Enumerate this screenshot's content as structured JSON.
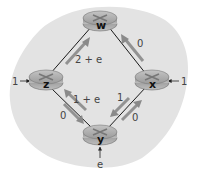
{
  "diagram": {
    "type": "network-routing",
    "background_color": "#e3e3e3",
    "router_color": "#a9a9a9",
    "link_color": "#1a1a1a",
    "flow_arrow_color": "#8e8e8e",
    "routers": [
      {
        "id": "w",
        "label": "w"
      },
      {
        "id": "z",
        "label": "z"
      },
      {
        "id": "x",
        "label": "x"
      },
      {
        "id": "y",
        "label": "y"
      }
    ],
    "links": [
      {
        "from": "z",
        "to": "w",
        "cost": "2 + e"
      },
      {
        "from": "x",
        "to": "w",
        "cost": "0"
      },
      {
        "from": "y",
        "to": "z",
        "cost": "1 + e"
      },
      {
        "from": "z",
        "to": "y",
        "cost": "0"
      },
      {
        "from": "x",
        "to": "y",
        "cost": "1"
      },
      {
        "from": "y",
        "to": "x",
        "cost": "0"
      }
    ],
    "external_inputs": [
      {
        "router": "z",
        "label": "1"
      },
      {
        "router": "x",
        "label": "1"
      },
      {
        "router": "y",
        "label": "e"
      }
    ]
  }
}
